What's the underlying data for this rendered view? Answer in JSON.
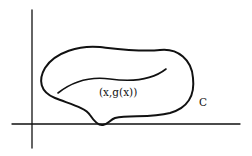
{
  "diagram": {
    "curve_label": "(x,g(x))",
    "region_label": "C",
    "colors": {
      "ink": "#111111",
      "background": "#ffffff"
    }
  }
}
